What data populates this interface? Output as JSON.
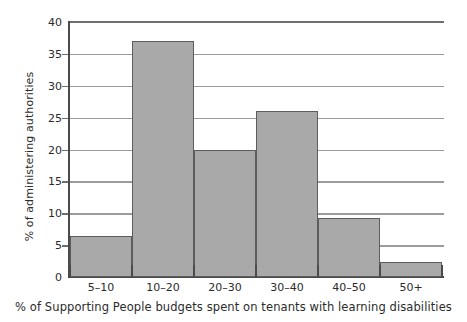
{
  "chart_data": {
    "type": "bar",
    "title": "",
    "subtitle": "",
    "xlabel": "% of Supporting People budgets spent on tenants with learning disabilities",
    "ylabel": "% of administering authorities",
    "categories": [
      "5–10",
      "10–20",
      "20–30",
      "30–40",
      "40–50",
      "50+"
    ],
    "values": [
      6.5,
      37.1,
      20.0,
      26.1,
      9.3,
      2.3
    ],
    "ylim": [
      0,
      40
    ],
    "ytick_labels": [
      "0",
      "5",
      "10",
      "15",
      "20",
      "25",
      "30",
      "35",
      "40"
    ],
    "ytick_values": [
      0,
      5,
      10,
      15,
      20,
      25,
      30,
      35,
      40
    ],
    "grid": true,
    "legend": false,
    "legend_position": "none",
    "colors": {
      "bar_fill": "#a9a9a9",
      "bar_border": "#5d5d5d",
      "gridline": "#9b9b9b",
      "axis": "#4a4a4a",
      "text": "#2b2b2b",
      "background": "#ffffff"
    }
  }
}
